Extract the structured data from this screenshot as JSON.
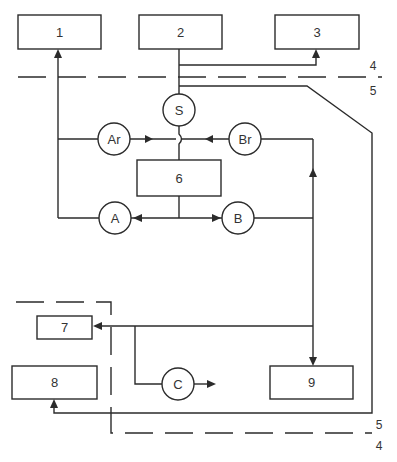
{
  "diagram": {
    "type": "block-flow-diagram",
    "colors": {
      "line": "#2b2b2b",
      "text": "#333333",
      "background": "#ffffff"
    },
    "boxes": [
      {
        "id": "1",
        "label": "1"
      },
      {
        "id": "2",
        "label": "2"
      },
      {
        "id": "3",
        "label": "3"
      },
      {
        "id": "6",
        "label": "6"
      },
      {
        "id": "7",
        "label": "7"
      },
      {
        "id": "8",
        "label": "8"
      },
      {
        "id": "9",
        "label": "9"
      }
    ],
    "nodes": [
      {
        "id": "S",
        "label": "S"
      },
      {
        "id": "Ar",
        "label": "Ar"
      },
      {
        "id": "Br",
        "label": "Br"
      },
      {
        "id": "A",
        "label": "A"
      },
      {
        "id": "B",
        "label": "B"
      },
      {
        "id": "C",
        "label": "C"
      }
    ],
    "boundary_labels": {
      "top_upper": "4",
      "top_lower": "5",
      "bottom_upper": "5",
      "bottom_lower": "4"
    },
    "connections": [
      {
        "from": "2",
        "to": "3",
        "arrow": "end"
      },
      {
        "from": "2",
        "to": "S"
      },
      {
        "from": "S",
        "to": "6",
        "note": "line hops over Ar-Br line"
      },
      {
        "from": "Ar",
        "to": "center",
        "arrow": "end"
      },
      {
        "from": "Br",
        "to": "center",
        "arrow": "end"
      },
      {
        "from": "Ar",
        "to": "1",
        "arrow": "end"
      },
      {
        "from": "6",
        "to": "A",
        "arrow": "end"
      },
      {
        "from": "6",
        "to": "B",
        "arrow": "end"
      },
      {
        "from": "A",
        "to": "1",
        "arrow": "end"
      },
      {
        "from": "B",
        "to": "Br",
        "arrow": "end"
      },
      {
        "from": "B",
        "to": "9",
        "arrow": "end"
      },
      {
        "from": "B",
        "to": "7",
        "arrow": "end"
      },
      {
        "from": "7-line",
        "to": "C"
      },
      {
        "from": "C",
        "to": "out",
        "arrow": "end"
      },
      {
        "from": "S",
        "to": "8",
        "via": "line 5 right side",
        "arrow": "end"
      }
    ]
  }
}
